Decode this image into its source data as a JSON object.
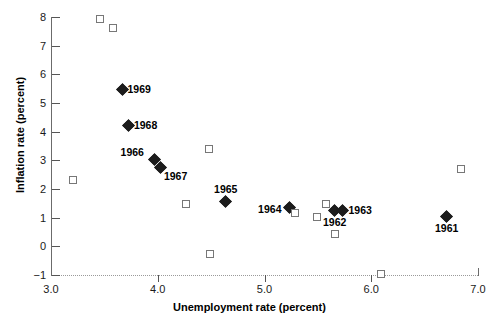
{
  "chart_data": {
    "type": "scatter",
    "title": "",
    "xlabel": "Unemployment rate (percent)",
    "ylabel": "Inflation rate (percent)",
    "xlim": [
      3.0,
      7.0
    ],
    "ylim": [
      -1,
      8
    ],
    "xticks": [
      "3.0",
      "4.0",
      "5.0",
      "6.0",
      "7.0"
    ],
    "xtick_values": [
      3.0,
      4.0,
      5.0,
      6.0,
      7.0
    ],
    "yticks": [
      "8",
      "7",
      "6",
      "5",
      "4",
      "3",
      "2",
      "1",
      "0",
      "−1"
    ],
    "ytick_values": [
      8,
      7,
      6,
      5,
      4,
      3,
      2,
      1,
      0,
      -1
    ],
    "grid": false,
    "legend": "none",
    "series": [
      {
        "name": "labeled-years",
        "marker": "filled-diamond",
        "color": "#1c1c1c",
        "points": [
          {
            "label": "1969",
            "x": 3.67,
            "y": 5.45,
            "label_pos": "right"
          },
          {
            "label": "1968",
            "x": 3.73,
            "y": 4.2,
            "label_pos": "right"
          },
          {
            "label": "1966",
            "x": 3.97,
            "y": 3.02,
            "label_pos": "left-up"
          },
          {
            "label": "1967",
            "x": 4.03,
            "y": 2.75,
            "label_pos": "right-down"
          },
          {
            "label": "1965",
            "x": 4.64,
            "y": 1.55,
            "label_pos": "above"
          },
          {
            "label": "1964",
            "x": 5.24,
            "y": 1.32,
            "label_pos": "left"
          },
          {
            "label": "1962",
            "x": 5.66,
            "y": 1.22,
            "label_pos": "below"
          },
          {
            "label": "1963",
            "x": 5.74,
            "y": 1.24,
            "label_pos": "right"
          },
          {
            "label": "1961",
            "x": 6.71,
            "y": 1.02,
            "label_pos": "below"
          }
        ]
      },
      {
        "name": "other-years",
        "marker": "open-square",
        "color": "#777777",
        "points": [
          {
            "label": "",
            "x": 3.46,
            "y": 7.92
          },
          {
            "label": "",
            "x": 3.58,
            "y": 7.62
          },
          {
            "label": "",
            "x": 3.21,
            "y": 2.3
          },
          {
            "label": "",
            "x": 4.48,
            "y": 3.38
          },
          {
            "label": "",
            "x": 4.26,
            "y": 1.46
          },
          {
            "label": "",
            "x": 4.49,
            "y": -0.28
          },
          {
            "label": "",
            "x": 5.29,
            "y": 1.18
          },
          {
            "label": "",
            "x": 5.58,
            "y": 1.48
          },
          {
            "label": "",
            "x": 5.49,
            "y": 1.02
          },
          {
            "label": "",
            "x": 5.66,
            "y": 0.42
          },
          {
            "label": "",
            "x": 6.09,
            "y": -0.95
          },
          {
            "label": "",
            "x": 6.84,
            "y": 2.7
          }
        ]
      }
    ]
  }
}
